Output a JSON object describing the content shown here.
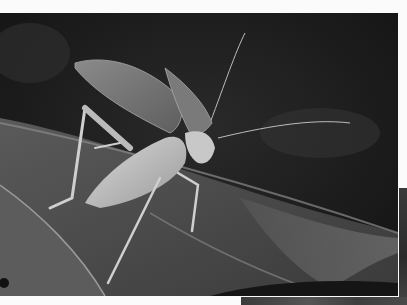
{
  "image": {
    "subject": "katydid on leaves",
    "description": "Grayscale photograph of a pale katydid with raised wings standing on dark leaves",
    "tone": "grayscale",
    "colors": {
      "background": "#1d1d1d",
      "leaf_light": "#6e6e6e",
      "leaf_mid": "#4a4a4a",
      "insect": "#bdbdbd",
      "page_margin": "#fbfbfb"
    }
  }
}
